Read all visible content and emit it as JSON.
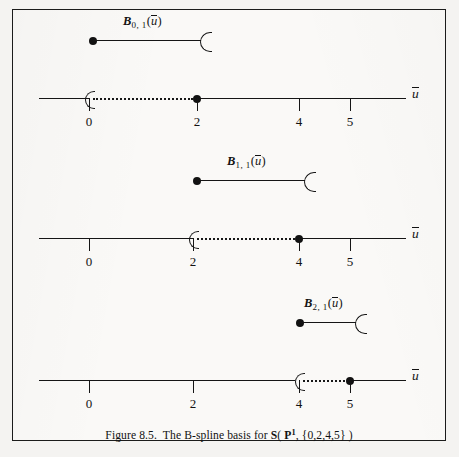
{
  "figure": {
    "caption_prefix": "Figure 8.5.",
    "caption_text_a": "The B-spline basis for",
    "caption_space_symbol": "S",
    "caption_open_paren": "(",
    "caption_poly_symbol": "P",
    "caption_poly_degree": "1",
    "caption_comma": ",",
    "caption_knot_vector": "{0,2,4,5}",
    "caption_close_paren": ")",
    "border_color": "#1b1b1b",
    "ink_color": "#151515",
    "paper_color": "#faf9f7"
  },
  "axis": {
    "variable_label": "u",
    "tick_values": [
      "0",
      "2",
      "4",
      "5"
    ],
    "knot_vector": [
      0,
      2,
      4,
      5
    ],
    "domain_start": 0,
    "domain_end": 5
  },
  "panels": [
    {
      "id": "B01",
      "basis_label_base": "B",
      "basis_label_subscript": "0, 1",
      "basis_label_arg": "(u)",
      "support_start": "0",
      "support_end": "2",
      "support_start_marker": "open-bracket",
      "support_end_marker": "filled-dot",
      "ticks": [
        {
          "value": "0",
          "marker": "open-bracket"
        },
        {
          "value": "2",
          "marker": "filled-dot"
        },
        {
          "value": "4",
          "marker": "tick"
        },
        {
          "value": "5",
          "marker": "tick"
        }
      ]
    },
    {
      "id": "B11",
      "basis_label_base": "B",
      "basis_label_subscript": "1, 1",
      "basis_label_arg": "(u)",
      "support_start": "2",
      "support_end": "4",
      "support_start_marker": "open-bracket",
      "support_end_marker": "filled-dot",
      "ticks": [
        {
          "value": "0",
          "marker": "tick"
        },
        {
          "value": "2",
          "marker": "open-bracket"
        },
        {
          "value": "4",
          "marker": "filled-dot"
        },
        {
          "value": "5",
          "marker": "tick"
        }
      ]
    },
    {
      "id": "B21",
      "basis_label_base": "B",
      "basis_label_subscript": "2, 1",
      "basis_label_arg": "(u)",
      "support_start": "4",
      "support_end": "5",
      "support_start_marker": "open-bracket",
      "support_end_marker": "filled-dot",
      "ticks": [
        {
          "value": "0",
          "marker": "tick"
        },
        {
          "value": "2",
          "marker": "tick"
        },
        {
          "value": "4",
          "marker": "open-bracket"
        },
        {
          "value": "5",
          "marker": "filled-dot"
        }
      ]
    }
  ]
}
